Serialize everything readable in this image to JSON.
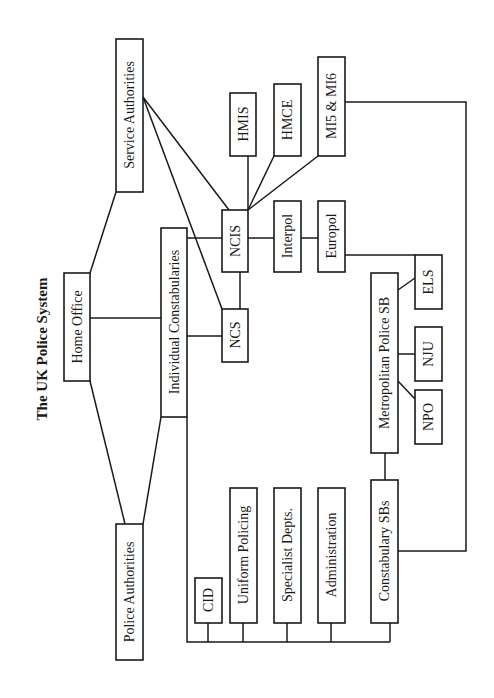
{
  "title": "The UK Police System",
  "colors": {
    "line": "#1a1a1a",
    "background": "#ffffff"
  },
  "nodes": {
    "home_office": "Home Office",
    "service_authorities": "Service Authorities",
    "police_authorities": "Police Authorities",
    "individual_constabularies": "Individual Constabularies",
    "ncis": "NCIS",
    "ncs": "NCS",
    "hmis": "HMIS",
    "hmce": "HMCE",
    "mi5_mi6": "MI5 & MI6",
    "interpol": "Interpol",
    "europol": "Europol",
    "els": "ELS",
    "nju": "NJU",
    "npo": "NPO",
    "metropolitan_police_sb": "Metropolitan Police SB",
    "cid": "CID",
    "uniform_policing": "Uniform Policing",
    "specialist_depts": "Specialist Depts.",
    "administration": "Administration",
    "constabulary_sbs": "Constabulary SBs"
  },
  "edges": [
    [
      "home_office",
      "service_authorities"
    ],
    [
      "home_office",
      "police_authorities"
    ],
    [
      "home_office",
      "individual_constabularies"
    ],
    [
      "police_authorities",
      "individual_constabularies"
    ],
    [
      "service_authorities",
      "ncis"
    ],
    [
      "service_authorities",
      "ncs"
    ],
    [
      "individual_constabularies",
      "ncis"
    ],
    [
      "individual_constabularies",
      "ncs"
    ],
    [
      "ncis",
      "ncs"
    ],
    [
      "ncis",
      "hmis"
    ],
    [
      "ncis",
      "hmce"
    ],
    [
      "ncis",
      "mi5_mi6"
    ],
    [
      "ncis",
      "interpol"
    ],
    [
      "interpol",
      "europol"
    ],
    [
      "europol",
      "els"
    ],
    [
      "metropolitan_police_sb",
      "els"
    ],
    [
      "metropolitan_police_sb",
      "nju"
    ],
    [
      "metropolitan_police_sb",
      "npo"
    ],
    [
      "metropolitan_police_sb",
      "constabulary_sbs"
    ],
    [
      "mi5_mi6",
      "constabulary_sbs"
    ],
    [
      "individual_constabularies",
      "cid"
    ],
    [
      "individual_constabularies",
      "uniform_policing"
    ],
    [
      "individual_constabularies",
      "specialist_depts"
    ],
    [
      "individual_constabularies",
      "administration"
    ],
    [
      "individual_constabularies",
      "constabulary_sbs"
    ]
  ]
}
